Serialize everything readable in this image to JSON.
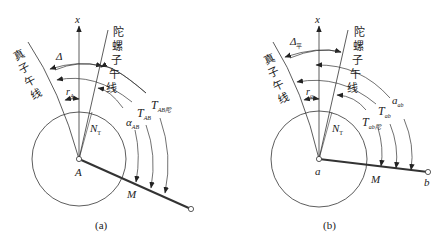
{
  "panel_a": {
    "caption": "(a)",
    "axis_label": "x",
    "true_meridian_label": [
      "真",
      "子",
      "午",
      "线"
    ],
    "gyro_meridian_label": [
      "陀",
      "螺",
      "子",
      "午",
      "线"
    ],
    "delta_label": "Δ",
    "r_label": "r",
    "r_sub": "A",
    "nt_label": "N",
    "nt_sub": "T",
    "center_label": "A",
    "m_label": "M",
    "alpha_label": "α",
    "alpha_sub": "AB",
    "t_label": "T",
    "t_sub": "AB",
    "tg_label": "T",
    "tg_sub": "AB陀"
  },
  "panel_b": {
    "caption": "(b)",
    "axis_label": "x",
    "true_meridian_label": [
      "真",
      "子",
      "午",
      "线"
    ],
    "gyro_meridian_label": [
      "陀",
      "螺",
      "子",
      "午",
      "线"
    ],
    "delta_label": "Δ",
    "delta_sub": "平",
    "r_label": "r",
    "r_sub": "a",
    "nt_label": "N",
    "nt_sub": "T",
    "center_label": "a",
    "end_label": "b",
    "m_label": "M",
    "alpha_label": "a",
    "alpha_sub": "ab",
    "t_label": "T",
    "t_sub": "ab",
    "tg_label": "T",
    "tg_sub": "ab陀"
  }
}
